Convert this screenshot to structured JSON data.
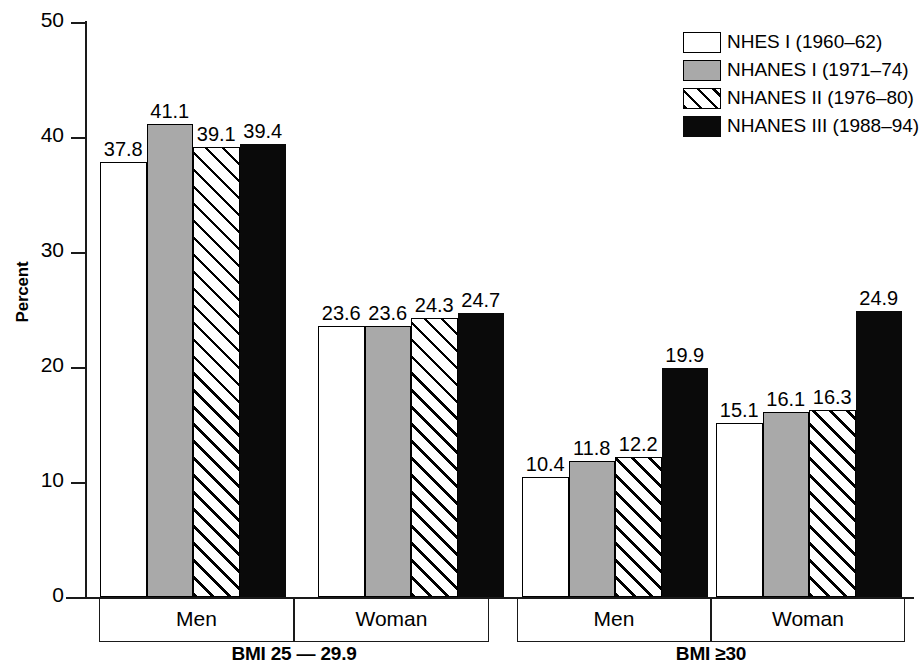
{
  "chart_data": {
    "type": "bar",
    "title": "",
    "xlabel": "",
    "ylabel": "Percent",
    "ylim": [
      0,
      50
    ],
    "yticks": [
      "0",
      "10",
      "20",
      "30",
      "40",
      "50"
    ],
    "grid": false,
    "legend_position": "top-right",
    "panels": [
      {
        "panel_label": "BMI 25 — 29.9",
        "categories": [
          "Men",
          "Woman"
        ]
      },
      {
        "panel_label": "BMI ≥30",
        "categories": [
          "Men",
          "Woman"
        ]
      }
    ],
    "categories": [
      "BMI 25 — 29.9 / Men",
      "BMI 25 — 29.9 / Woman",
      "BMI ≥30 / Men",
      "BMI ≥30 / Woman"
    ],
    "series": [
      {
        "name": "NHES I (1960–62)",
        "fill": "white",
        "values": [
          37.8,
          23.6,
          10.4,
          15.1
        ]
      },
      {
        "name": "NHANES I (1971–74",
        "fill": "gray",
        "values": [
          41.1,
          23.6,
          11.8,
          16.1
        ]
      },
      {
        "name": "NHANES II (1976–80)",
        "fill": "hatch",
        "values": [
          39.1,
          24.3,
          12.2,
          16.3
        ]
      },
      {
        "name": "NHANES III (1988–94)",
        "fill": "black",
        "values": [
          39.4,
          24.7,
          19.9,
          24.9
        ]
      }
    ],
    "bar_labels": [
      [
        "37.8",
        "41.1",
        "39.1",
        "39.4"
      ],
      [
        "23.6",
        "23.6",
        "24.3",
        "24.7"
      ],
      [
        "10.4",
        "11.8",
        "12.2",
        "19.9"
      ],
      [
        "15.1",
        "16.1",
        "16.3",
        "24.9"
      ]
    ]
  },
  "axis": {
    "y_label": "Percent",
    "y_ticks": [
      "50",
      "40",
      "30",
      "20",
      "10",
      "0"
    ]
  },
  "legend": {
    "items": [
      {
        "label": "NHES I (1960–62)",
        "fill": "white"
      },
      {
        "label": "NHANES I (1971–74)",
        "fill": "gray"
      },
      {
        "label": "NHANES II (1976–80)",
        "fill": "hatch"
      },
      {
        "label": "NHANES III (1988–94)",
        "fill": "black"
      }
    ]
  },
  "groups": [
    {
      "category": "Men",
      "panel": "BMI 25 — 29.9"
    },
    {
      "category": "Woman",
      "panel": "BMI 25 — 29.9"
    },
    {
      "category": "Men",
      "panel": "BMI ≥30"
    },
    {
      "category": "Woman",
      "panel": "BMI ≥30"
    }
  ],
  "panels": [
    {
      "label": "BMI 25 — 29.9"
    },
    {
      "label": "BMI ≥30"
    }
  ],
  "colors": {
    "axis": "#1a1a1a",
    "bar_white": "#ffffff",
    "bar_gray": "#a9a9a9",
    "bar_black": "#0a0a0a",
    "background": "#ffffff"
  }
}
